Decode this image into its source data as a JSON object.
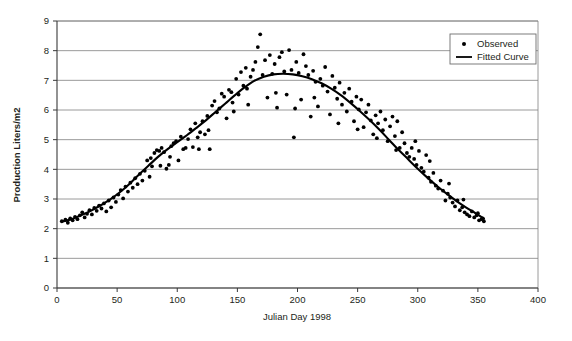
{
  "chart_data": {
    "type": "scatter",
    "title": "",
    "xlabel": "Julian Day 1998",
    "ylabel": "Production Liters/m2",
    "xlim": [
      0,
      400
    ],
    "ylim": [
      0,
      9
    ],
    "xticks": [
      0,
      50,
      100,
      150,
      200,
      250,
      300,
      350,
      400
    ],
    "yticks": [
      0,
      1,
      2,
      3,
      4,
      5,
      6,
      7,
      8,
      9
    ],
    "grid": "horizontal",
    "legend_position": "top-right",
    "series": [
      {
        "name": "Observed",
        "type": "scatter",
        "marker": "dot",
        "color": "#000000",
        "points": [
          [
            4,
            2.25
          ],
          [
            7,
            2.3
          ],
          [
            9,
            2.2
          ],
          [
            11,
            2.35
          ],
          [
            13,
            2.28
          ],
          [
            15,
            2.4
          ],
          [
            17,
            2.32
          ],
          [
            19,
            2.45
          ],
          [
            21,
            2.55
          ],
          [
            23,
            2.38
          ],
          [
            25,
            2.5
          ],
          [
            27,
            2.62
          ],
          [
            29,
            2.48
          ],
          [
            31,
            2.7
          ],
          [
            33,
            2.6
          ],
          [
            35,
            2.78
          ],
          [
            37,
            2.68
          ],
          [
            39,
            2.85
          ],
          [
            41,
            2.58
          ],
          [
            43,
            2.95
          ],
          [
            45,
            2.72
          ],
          [
            47,
            3.05
          ],
          [
            49,
            2.9
          ],
          [
            51,
            3.15
          ],
          [
            53,
            3.3
          ],
          [
            55,
            3.02
          ],
          [
            57,
            3.42
          ],
          [
            59,
            3.25
          ],
          [
            61,
            3.55
          ],
          [
            63,
            3.38
          ],
          [
            65,
            3.7
          ],
          [
            67,
            3.5
          ],
          [
            69,
            3.85
          ],
          [
            71,
            3.62
          ],
          [
            73,
            3.95
          ],
          [
            75,
            4.3
          ],
          [
            77,
            3.75
          ],
          [
            79,
            4.1
          ],
          [
            81,
            4.55
          ],
          [
            83,
            4.65
          ],
          [
            85,
            4.62
          ],
          [
            87,
            4.72
          ],
          [
            89,
            4.58
          ],
          [
            91,
            4.02
          ],
          [
            93,
            4.15
          ],
          [
            95,
            4.78
          ],
          [
            97,
            4.88
          ],
          [
            99,
            4.95
          ],
          [
            101,
            4.3
          ],
          [
            103,
            5.1
          ],
          [
            105,
            4.68
          ],
          [
            107,
            4.72
          ],
          [
            109,
            5.02
          ],
          [
            111,
            5.35
          ],
          [
            113,
            4.75
          ],
          [
            115,
            5.55
          ],
          [
            117,
            5.08
          ],
          [
            119,
            5.25
          ],
          [
            121,
            5.62
          ],
          [
            123,
            5.18
          ],
          [
            125,
            5.8
          ],
          [
            127,
            4.68
          ],
          [
            129,
            6.15
          ],
          [
            131,
            6.3
          ],
          [
            133,
            5.92
          ],
          [
            135,
            6.05
          ],
          [
            137,
            6.55
          ],
          [
            139,
            6.45
          ],
          [
            141,
            5.72
          ],
          [
            143,
            6.68
          ],
          [
            145,
            6.6
          ],
          [
            147,
            5.95
          ],
          [
            149,
            7.05
          ],
          [
            151,
            6.52
          ],
          [
            153,
            7.28
          ],
          [
            155,
            6.82
          ],
          [
            157,
            7.42
          ],
          [
            159,
            6.18
          ],
          [
            161,
            7.12
          ],
          [
            163,
            7.35
          ],
          [
            165,
            7.62
          ],
          [
            167,
            8.12
          ],
          [
            169,
            8.55
          ],
          [
            171,
            7.18
          ],
          [
            173,
            7.68
          ],
          [
            175,
            6.42
          ],
          [
            177,
            7.85
          ],
          [
            179,
            7.22
          ],
          [
            181,
            7.55
          ],
          [
            183,
            6.08
          ],
          [
            185,
            7.78
          ],
          [
            187,
            7.95
          ],
          [
            189,
            7.3
          ],
          [
            191,
            6.52
          ],
          [
            193,
            8.02
          ],
          [
            195,
            7.35
          ],
          [
            197,
            5.08
          ],
          [
            199,
            7.62
          ],
          [
            201,
            7.25
          ],
          [
            203,
            6.35
          ],
          [
            205,
            7.88
          ],
          [
            207,
            7.48
          ],
          [
            209,
            7.18
          ],
          [
            211,
            5.78
          ],
          [
            213,
            7.32
          ],
          [
            215,
            6.95
          ],
          [
            217,
            6.12
          ],
          [
            219,
            7.05
          ],
          [
            221,
            6.82
          ],
          [
            223,
            7.45
          ],
          [
            225,
            6.62
          ],
          [
            227,
            5.85
          ],
          [
            229,
            7.15
          ],
          [
            231,
            6.75
          ],
          [
            233,
            6.38
          ],
          [
            235,
            6.92
          ],
          [
            237,
            6.18
          ],
          [
            239,
            6.58
          ],
          [
            241,
            5.95
          ],
          [
            243,
            6.72
          ],
          [
            245,
            6.28
          ],
          [
            247,
            5.62
          ],
          [
            249,
            6.45
          ],
          [
            251,
            6.02
          ],
          [
            253,
            6.35
          ],
          [
            255,
            5.42
          ],
          [
            257,
            5.92
          ],
          [
            259,
            6.18
          ],
          [
            261,
            5.65
          ],
          [
            263,
            5.18
          ],
          [
            265,
            5.82
          ],
          [
            267,
            5.55
          ],
          [
            269,
            5.95
          ],
          [
            271,
            5.32
          ],
          [
            273,
            5.68
          ],
          [
            275,
            4.95
          ],
          [
            277,
            5.45
          ],
          [
            279,
            5.78
          ],
          [
            281,
            5.12
          ],
          [
            283,
            5.62
          ],
          [
            285,
            4.72
          ],
          [
            287,
            5.25
          ],
          [
            289,
            4.88
          ],
          [
            291,
            4.55
          ],
          [
            293,
            4.42
          ],
          [
            295,
            4.72
          ],
          [
            297,
            4.35
          ],
          [
            299,
            4.15
          ],
          [
            301,
            4.62
          ],
          [
            303,
            4.05
          ],
          [
            305,
            3.92
          ],
          [
            307,
            4.48
          ],
          [
            309,
            3.72
          ],
          [
            311,
            3.58
          ],
          [
            313,
            3.88
          ],
          [
            315,
            3.45
          ],
          [
            317,
            3.35
          ],
          [
            319,
            3.62
          ],
          [
            321,
            3.28
          ],
          [
            323,
            2.95
          ],
          [
            325,
            3.18
          ],
          [
            327,
            3.05
          ],
          [
            329,
            2.88
          ],
          [
            331,
            2.75
          ],
          [
            333,
            2.95
          ],
          [
            335,
            2.62
          ],
          [
            337,
            2.72
          ],
          [
            339,
            2.55
          ],
          [
            341,
            2.48
          ],
          [
            343,
            2.42
          ],
          [
            345,
            2.58
          ],
          [
            347,
            2.38
          ],
          [
            349,
            2.45
          ],
          [
            351,
            2.28
          ],
          [
            353,
            2.32
          ],
          [
            355,
            2.25
          ],
          [
            78,
            4.38
          ],
          [
            86,
            4.12
          ],
          [
            94,
            4.42
          ],
          [
            118,
            4.68
          ],
          [
            126,
            5.32
          ],
          [
            146,
            6.25
          ],
          [
            158,
            6.72
          ],
          [
            182,
            6.58
          ],
          [
            198,
            6.05
          ],
          [
            214,
            6.42
          ],
          [
            234,
            5.55
          ],
          [
            250,
            5.35
          ],
          [
            266,
            5.05
          ],
          [
            282,
            4.65
          ],
          [
            298,
            4.95
          ],
          [
            310,
            4.28
          ],
          [
            326,
            3.52
          ],
          [
            338,
            2.98
          ],
          [
            350,
            2.52
          ],
          [
            354,
            2.35
          ]
        ]
      },
      {
        "name": "Fitted Curve",
        "type": "line",
        "color": "#000000",
        "points": [
          [
            4,
            2.24
          ],
          [
            12,
            2.32
          ],
          [
            20,
            2.45
          ],
          [
            28,
            2.6
          ],
          [
            36,
            2.78
          ],
          [
            44,
            2.98
          ],
          [
            52,
            3.22
          ],
          [
            60,
            3.5
          ],
          [
            68,
            3.82
          ],
          [
            76,
            4.12
          ],
          [
            84,
            4.42
          ],
          [
            92,
            4.68
          ],
          [
            100,
            4.92
          ],
          [
            108,
            5.15
          ],
          [
            116,
            5.4
          ],
          [
            124,
            5.66
          ],
          [
            132,
            5.94
          ],
          [
            140,
            6.22
          ],
          [
            148,
            6.5
          ],
          [
            156,
            6.76
          ],
          [
            164,
            6.98
          ],
          [
            172,
            7.12
          ],
          [
            180,
            7.2
          ],
          [
            188,
            7.22
          ],
          [
            196,
            7.2
          ],
          [
            204,
            7.14
          ],
          [
            212,
            7.04
          ],
          [
            220,
            6.9
          ],
          [
            228,
            6.72
          ],
          [
            236,
            6.5
          ],
          [
            244,
            6.24
          ],
          [
            252,
            5.96
          ],
          [
            260,
            5.66
          ],
          [
            268,
            5.34
          ],
          [
            276,
            5.0
          ],
          [
            284,
            4.66
          ],
          [
            292,
            4.34
          ],
          [
            300,
            4.02
          ],
          [
            308,
            3.72
          ],
          [
            316,
            3.44
          ],
          [
            324,
            3.18
          ],
          [
            332,
            2.94
          ],
          [
            340,
            2.72
          ],
          [
            348,
            2.52
          ],
          [
            355,
            2.34
          ]
        ]
      }
    ]
  },
  "axes": {
    "y_label": "Production Liters/m2",
    "x_label": "Julian Day 1998",
    "y_tick_labels": [
      "0",
      "1",
      "2",
      "3",
      "4",
      "5",
      "6",
      "7",
      "8",
      "9"
    ],
    "x_tick_labels": [
      "0",
      "50",
      "100",
      "150",
      "200",
      "250",
      "300",
      "350",
      "400"
    ]
  },
  "legend": {
    "entries": [
      {
        "label": "Observed",
        "marker": "dot"
      },
      {
        "label": "Fitted Curve",
        "marker": "line"
      }
    ]
  },
  "colors": {
    "data": "#000000",
    "grid": "#808080",
    "axis": "#3a3a3a",
    "background": "#ffffff"
  }
}
